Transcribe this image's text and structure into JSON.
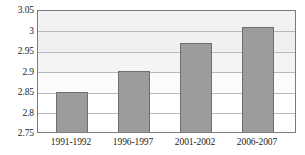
{
  "chart_data": {
    "type": "bar",
    "title": "",
    "subtitle": "",
    "xlabel": "",
    "ylabel": "",
    "categories": [
      "1991-1992",
      "1996-1997",
      "2001-2002",
      "2006-2007"
    ],
    "values": [
      2.85,
      2.9,
      2.97,
      3.01
    ],
    "series": [
      {
        "name": "",
        "values": [
          2.85,
          2.9,
          2.97,
          3.01
        ]
      }
    ],
    "ylim": [
      2.75,
      3.05
    ],
    "ytick_labels": [
      "3.05",
      "3",
      "2.95",
      "2.9",
      "2.85",
      "2.8",
      "2.75"
    ],
    "ytick_values": [
      3.05,
      3.0,
      2.95,
      2.9,
      2.85,
      2.8,
      2.75
    ],
    "ytick_step": 0.05,
    "grid": true,
    "grid_axis": "y",
    "legend": false,
    "legend_position": "none",
    "bar_color": "#9c9c9c",
    "bar_border_color": "#6e6e6e",
    "gridline_color": "#b9b9b9",
    "plot_border_color": "#7b7b7b",
    "plot_background": "#fdfdfd",
    "text_color": "#1c1c1c"
  }
}
